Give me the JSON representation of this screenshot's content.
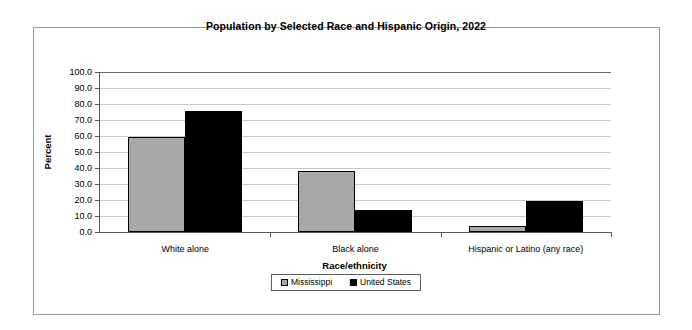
{
  "chart_data": {
    "type": "bar",
    "title": "Population by Selected Race and Hispanic Origin, 2022",
    "xlabel": "Race/ethnicity",
    "ylabel": "Percent",
    "categories": [
      "White alone",
      "Black alone",
      "Hispanic or Latino (any race)"
    ],
    "series": [
      {
        "name": "Mississippi",
        "color": "#a8a8a8",
        "values": [
          59.1,
          37.9,
          3.6
        ]
      },
      {
        "name": "United States",
        "color": "#000000",
        "values": [
          75.5,
          13.6,
          19.1
        ]
      }
    ],
    "ylim": [
      0,
      100
    ],
    "ytick_labels": [
      "100.0",
      "90.0",
      "80.0",
      "70.0",
      "60.0",
      "50.0",
      "40.0",
      "30.0",
      "20.0",
      "10.0",
      "0.0"
    ],
    "ytick_values": [
      100,
      90,
      80,
      70,
      60,
      50,
      40,
      30,
      20,
      10,
      0
    ],
    "grid": true,
    "legend_position": "bottom"
  }
}
